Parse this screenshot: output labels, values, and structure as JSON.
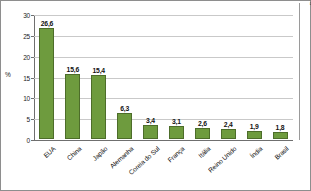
{
  "chart_data": {
    "type": "bar",
    "title": "",
    "xlabel": "",
    "ylabel": "%",
    "ylim": [
      0,
      30
    ],
    "yticks": [
      "0",
      "5",
      "10",
      "15",
      "20",
      "25",
      "30"
    ],
    "grid": true,
    "legend": false,
    "categories": [
      "EUA",
      "China",
      "Japão",
      "Alemanha",
      "Coreia do Sul",
      "França",
      "Itália",
      "Reino Unido",
      "Índia",
      "Brasil"
    ],
    "values": [
      26.6,
      15.6,
      15.4,
      6.3,
      3.4,
      3.1,
      2.6,
      2.4,
      1.9,
      1.8
    ],
    "value_labels": [
      "26,6",
      "15,6",
      "15,4",
      "6,3",
      "3,4",
      "3,1",
      "2,6",
      "2,4",
      "1,9",
      "1,8"
    ],
    "bar_color": "#6e9b3e",
    "bar_border_color": "#4d6d2a",
    "grid_color": "#c9c9c9",
    "axis_color": "#6f6f6f"
  },
  "credit": {
    "text": "Almaps/Arquivo da editora"
  }
}
